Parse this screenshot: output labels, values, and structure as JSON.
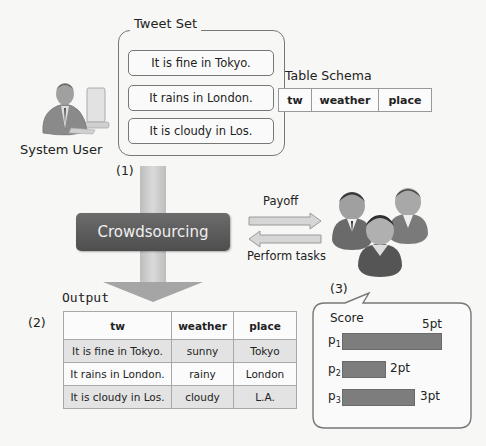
{
  "tweet_set": {
    "title": "Tweet Set",
    "tweets": [
      "It is fine in Tokyo.",
      "It rains in London.",
      "It is cloudy in Los."
    ]
  },
  "table_schema": {
    "title": "Table Schema",
    "columns": [
      "tw",
      "weather",
      "place"
    ]
  },
  "system_user": {
    "label": "System User",
    "icon": "person-at-computer-icon"
  },
  "steps": {
    "step1": "(1)",
    "step2": "(2)",
    "step3": "(3)"
  },
  "crowdsourcing": {
    "label": "Crowdsourcing"
  },
  "exchange": {
    "payoff_label": "Payoff",
    "perform_label": "Perform tasks"
  },
  "workers": {
    "icon": "crowd-workers-icon"
  },
  "score": {
    "title": "Score",
    "workers": [
      {
        "name": "p",
        "sub": "1",
        "value": 5,
        "label": "5pt"
      },
      {
        "name": "p",
        "sub": "2",
        "value": 2,
        "label": "2pt"
      },
      {
        "name": "p",
        "sub": "3",
        "value": 3,
        "label": "3pt"
      }
    ]
  },
  "output": {
    "title": "Output",
    "columns": [
      "tw",
      "weather",
      "place"
    ],
    "rows": [
      [
        "It is fine in Tokyo.",
        "sunny",
        "Tokyo"
      ],
      [
        "It rains in London.",
        "rainy",
        "London"
      ],
      [
        "It is cloudy in Los.",
        "cloudy",
        "L.A."
      ]
    ]
  },
  "colors": {
    "background": "#f7f7f5",
    "crowdsourcing_box": "#5a5a5a",
    "arrow": "#c4c4c4",
    "bar": "#7d7d7d",
    "table_shade": "#e3e3e3"
  }
}
